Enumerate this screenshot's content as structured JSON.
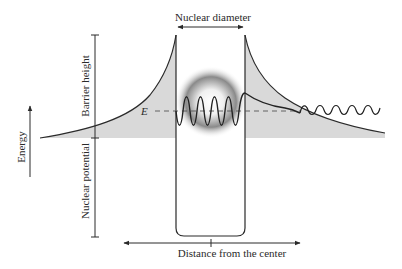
{
  "diagram": {
    "labels": {
      "top": "Nuclear diameter",
      "bottom": "Distance from the center",
      "energy_axis": "Energy",
      "barrier": "Barrier height",
      "potential": "Nuclear potential",
      "energy_level": "E"
    },
    "colors": {
      "line": "#2a2a2a",
      "barrier_fill": "#d9d9d9",
      "nucleus_glow": "#7a7a7a",
      "background": "#ffffff"
    }
  }
}
